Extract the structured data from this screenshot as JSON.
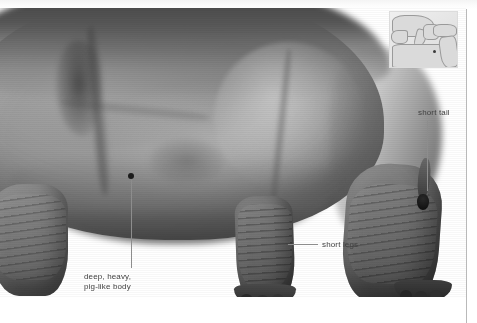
{
  "figure": {
    "view": "grayscale photograph of hippopotamus body, hindquarters and legs",
    "background_color": "#ffffff",
    "label_color": "#3f3f3f",
    "leader_color": "#8d8d8d",
    "marker_color": "#1c1c1c"
  },
  "annotations": [
    {
      "id": "tail",
      "text": "short tail",
      "leader": "vertical"
    },
    {
      "id": "legs",
      "text": "short legs",
      "leader": "horizontal"
    },
    {
      "id": "body",
      "line1": "deep, heavy,",
      "line2": "pig-like body",
      "leader": "vertical-with-dot"
    }
  ],
  "map_inset": {
    "name": "locator-map",
    "region": "Mediterranean and North Africa",
    "has_marker": true,
    "sea_color": "#e9e9e9",
    "land_color": "#dadada",
    "marker_color": "#3b3b3b"
  },
  "chrome": {
    "divider_color": "#b9b9b9",
    "top_frame_color": "#f4f4f4"
  }
}
